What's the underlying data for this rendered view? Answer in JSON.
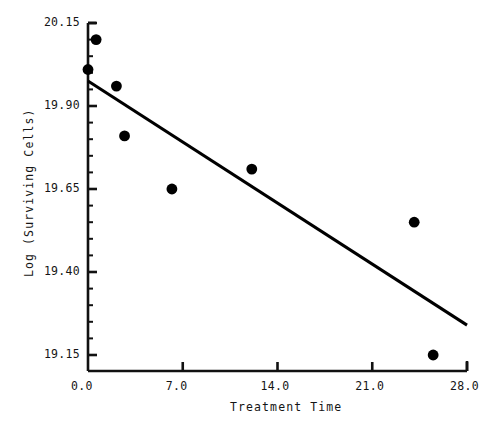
{
  "chart_data": {
    "type": "scatter",
    "title": "",
    "subtitle": "",
    "xlabel": "Treatment Time",
    "ylabel": "Log (Surviving Cells)",
    "xlim": [
      0.0,
      28.0
    ],
    "ylim": [
      19.15,
      20.15
    ],
    "xticks": [
      0.0,
      7.0,
      14.0,
      21.0,
      28.0
    ],
    "yticks": [
      19.15,
      19.4,
      19.65,
      19.9,
      20.15
    ],
    "xtick_labels": [
      "0.0",
      "7.0",
      "14.0",
      "21.0",
      "28.0"
    ],
    "ytick_labels": [
      "19.15",
      "19.40",
      "19.65",
      "19.90",
      "20.15"
    ],
    "minor_ticks_per_interval": 5,
    "grid": false,
    "legend": null,
    "marker": "filled-circle",
    "marker_color": "#000000",
    "points": [
      {
        "x": 0.6,
        "y": 20.1
      },
      {
        "x": 0.0,
        "y": 20.01
      },
      {
        "x": 2.1,
        "y": 19.96
      },
      {
        "x": 2.7,
        "y": 19.81
      },
      {
        "x": 6.2,
        "y": 19.65
      },
      {
        "x": 12.1,
        "y": 19.71
      },
      {
        "x": 24.1,
        "y": 19.55
      },
      {
        "x": 25.5,
        "y": 19.15
      }
    ],
    "series": [
      {
        "name": "observations",
        "type": "scatter",
        "x": [
          0.6,
          0.0,
          2.1,
          2.7,
          6.2,
          12.1,
          24.1,
          25.5
        ],
        "values": [
          20.1,
          20.01,
          19.96,
          19.81,
          19.65,
          19.71,
          19.55,
          19.15
        ]
      },
      {
        "name": "fitted-regression-line",
        "type": "line",
        "x": [
          0.0,
          28.0
        ],
        "values": [
          19.975,
          19.24
        ],
        "color": "#000000",
        "width": 3
      }
    ],
    "annotations": []
  },
  "axes": {
    "x_title": "Treatment Time",
    "y_title": "Log (Surviving Cells)"
  },
  "colors": {
    "axis": "#111111",
    "marker": "#000000",
    "line": "#000000",
    "background": "#ffffff"
  }
}
